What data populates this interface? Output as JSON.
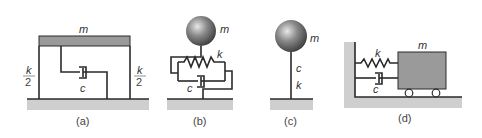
{
  "colors": {
    "mass": "#9a9a9a",
    "ground": "#cfcfcf",
    "line": "#2a2a2a",
    "text": "#333333"
  },
  "panels": [
    {
      "id": "a",
      "caption": "(a)",
      "mass_label": "m",
      "damper_label": "c",
      "spring_left_num": "k",
      "spring_left_den": "2",
      "spring_right_num": "k",
      "spring_right_den": "2"
    },
    {
      "id": "b",
      "caption": "(b)",
      "mass_label": "m",
      "spring_label": "k",
      "damper_label": "c"
    },
    {
      "id": "c",
      "caption": "(c)",
      "mass_label": "m",
      "damper_label": "c",
      "spring_label": "k"
    },
    {
      "id": "d",
      "caption": "(d)",
      "mass_label": "m",
      "spring_label": "k",
      "damper_label": "c"
    }
  ]
}
